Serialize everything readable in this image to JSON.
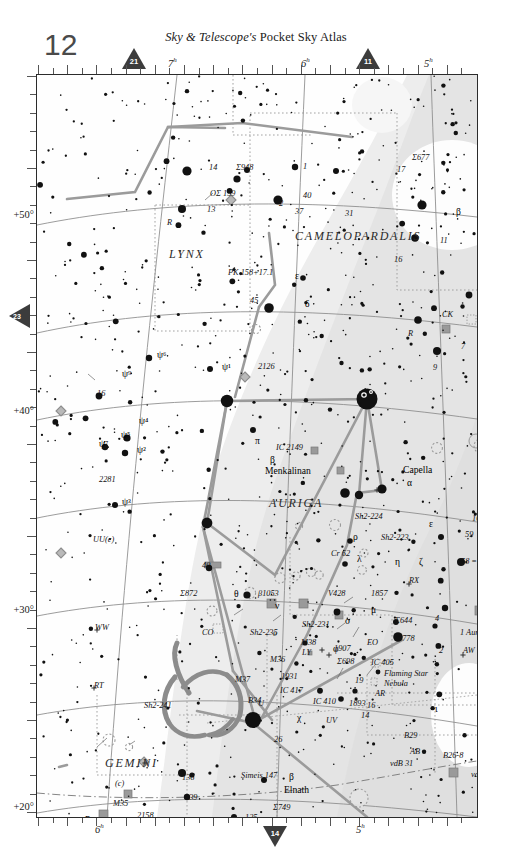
{
  "header": {
    "masthead_italic": "Sky & Telescope's",
    "masthead_rest": " Pocket Sky Atlas",
    "page_number": "12"
  },
  "page_links": {
    "top_left": "21",
    "top_right": "11",
    "bottom": "14",
    "left": "23"
  },
  "axes": {
    "ra_top": [
      "7",
      "6",
      "5"
    ],
    "ra_bottom": [
      "6",
      "5"
    ],
    "ra_unit": "h",
    "dec_labels": [
      "+50°",
      "+40°",
      "+30°",
      "+20°"
    ]
  },
  "constellations": [
    {
      "name": "LYNX",
      "x": 132,
      "y": 183
    },
    {
      "name": "CAMELOPARDALIS",
      "x": 258,
      "y": 165
    },
    {
      "name": "AURIGA",
      "x": 232,
      "y": 432
    },
    {
      "name": "GEMINI",
      "x": 68,
      "y": 692
    },
    {
      "name": "ORION",
      "x": 110,
      "y": 808
    },
    {
      "name": "TAURUS",
      "x": 290,
      "y": 775
    }
  ],
  "named_stars": [
    {
      "label": "Capella",
      "x": 366,
      "y": 398
    },
    {
      "label": "Menkalinan",
      "x": 228,
      "y": 399
    },
    {
      "label": "Elnath",
      "x": 247,
      "y": 718
    },
    {
      "label": "Propus",
      "x": 48,
      "y": 748
    }
  ],
  "greek_labels": [
    {
      "t": "α",
      "x": 370,
      "y": 411
    },
    {
      "t": "β",
      "x": 233,
      "y": 388
    },
    {
      "t": "π",
      "x": 218,
      "y": 369
    },
    {
      "t": "β",
      "x": 252,
      "y": 705
    },
    {
      "t": "ε",
      "x": 392,
      "y": 452
    },
    {
      "t": "ζ",
      "x": 382,
      "y": 490
    },
    {
      "t": "η",
      "x": 358,
      "y": 490
    },
    {
      "t": "θ",
      "x": 197,
      "y": 522
    },
    {
      "t": "ι",
      "x": 398,
      "y": 637
    },
    {
      "t": "λ",
      "x": 320,
      "y": 487
    },
    {
      "t": "μ",
      "x": 334,
      "y": 538
    },
    {
      "t": "ν",
      "x": 238,
      "y": 534
    },
    {
      "t": "ρ",
      "x": 316,
      "y": 465
    },
    {
      "t": "σ",
      "x": 308,
      "y": 549
    },
    {
      "t": "δ",
      "x": 268,
      "y": 232
    },
    {
      "t": "ε",
      "x": 258,
      "y": 204
    },
    {
      "t": "β",
      "x": 419,
      "y": 140
    },
    {
      "t": "η",
      "x": 57,
      "y": 764
    },
    {
      "t": "χ",
      "x": 260,
      "y": 646
    },
    {
      "t": "γ",
      "x": 63,
      "y": 791
    },
    {
      "t": "φ",
      "x": 296,
      "y": 577
    },
    {
      "t": "ψ¹",
      "x": 185,
      "y": 295
    },
    {
      "t": "ψ²",
      "x": 100,
      "y": 378
    },
    {
      "t": "ψ³",
      "x": 85,
      "y": 430
    },
    {
      "t": "ψ⁴",
      "x": 102,
      "y": 349
    },
    {
      "t": "ψ⁵",
      "x": 84,
      "y": 363
    },
    {
      "t": "ψ⁶",
      "x": 120,
      "y": 283
    },
    {
      "t": "ψ⁷",
      "x": 62,
      "y": 372
    },
    {
      "t": "ψ⁹",
      "x": 85,
      "y": 302
    }
  ],
  "deepsky_labels": [
    {
      "t": "Σ948",
      "x": 199,
      "y": 95
    },
    {
      "t": "ΟΣ 159",
      "x": 173,
      "y": 121
    },
    {
      "t": "Σ677",
      "x": 375,
      "y": 85
    },
    {
      "t": "PK 158+17.1",
      "x": 191,
      "y": 200
    },
    {
      "t": "RV",
      "x": 486,
      "y": 211
    },
    {
      "t": "CK",
      "x": 405,
      "y": 242
    },
    {
      "t": "B12",
      "x": 471,
      "y": 260
    },
    {
      "t": "1624",
      "x": 443,
      "y": 322
    },
    {
      "t": "2126",
      "x": 221,
      "y": 294
    },
    {
      "t": "IC 2149",
      "x": 239,
      "y": 375
    },
    {
      "t": "2281",
      "x": 62,
      "y": 407
    },
    {
      "t": "Sh2-224",
      "x": 318,
      "y": 444
    },
    {
      "t": "Sh2-223",
      "x": 344,
      "y": 465
    },
    {
      "t": "Cr 62",
      "x": 294,
      "y": 481
    },
    {
      "t": "1664",
      "x": 435,
      "y": 446
    },
    {
      "t": "1582",
      "x": 487,
      "y": 441
    },
    {
      "t": "59",
      "x": 428,
      "y": 462
    },
    {
      "t": "58 = e",
      "x": 424,
      "y": 489
    },
    {
      "t": "RX",
      "x": 372,
      "y": 508
    },
    {
      "t": "1857",
      "x": 334,
      "y": 521
    },
    {
      "t": "V428",
      "x": 291,
      "y": 521
    },
    {
      "t": "Σ872",
      "x": 143,
      "y": 521
    },
    {
      "t": "β1053",
      "x": 221,
      "y": 521
    },
    {
      "t": "Σ644",
      "x": 358,
      "y": 548
    },
    {
      "t": "1778",
      "x": 361,
      "y": 566
    },
    {
      "t": "1 Aur",
      "x": 423,
      "y": 560
    },
    {
      "t": "AW",
      "x": 426,
      "y": 578
    },
    {
      "t": "Sh2-231",
      "x": 265,
      "y": 552
    },
    {
      "t": "Sh2-235",
      "x": 213,
      "y": 560
    },
    {
      "t": "M38",
      "x": 264,
      "y": 570
    },
    {
      "t": "1907",
      "x": 297,
      "y": 576
    },
    {
      "t": "LY",
      "x": 265,
      "y": 580
    },
    {
      "t": "M36",
      "x": 233,
      "y": 587
    },
    {
      "t": "Σ698",
      "x": 300,
      "y": 589
    },
    {
      "t": "1931",
      "x": 244,
      "y": 604
    },
    {
      "t": "IC 417",
      "x": 243,
      "y": 618
    },
    {
      "t": "M37",
      "x": 198,
      "y": 607
    },
    {
      "t": "B34",
      "x": 211,
      "y": 628
    },
    {
      "t": "IC 410",
      "x": 276,
      "y": 629
    },
    {
      "t": "1893",
      "x": 312,
      "y": 631
    },
    {
      "t": "IC 405",
      "x": 334,
      "y": 590
    },
    {
      "t": "Flaming Star",
      "x": 347,
      "y": 601
    },
    {
      "t": "Nebula",
      "x": 347,
      "y": 611
    },
    {
      "t": "AR",
      "x": 338,
      "y": 621
    },
    {
      "t": "19",
      "x": 318,
      "y": 608
    },
    {
      "t": "16",
      "x": 330,
      "y": 633
    },
    {
      "t": "14",
      "x": 324,
      "y": 643
    },
    {
      "t": "UV",
      "x": 289,
      "y": 648
    },
    {
      "t": "EO",
      "x": 330,
      "y": 570
    },
    {
      "t": "CO",
      "x": 165,
      "y": 560
    },
    {
      "t": "WW",
      "x": 58,
      "y": 555
    },
    {
      "t": "UU(c)",
      "x": 56,
      "y": 467
    },
    {
      "t": "RT",
      "x": 57,
      "y": 613
    },
    {
      "t": "Sh2-241",
      "x": 107,
      "y": 633
    },
    {
      "t": "1579",
      "x": 481,
      "y": 599
    },
    {
      "t": "26",
      "x": 237,
      "y": 667
    },
    {
      "t": "B29",
      "x": 367,
      "y": 663
    },
    {
      "t": "AB",
      "x": 373,
      "y": 679
    },
    {
      "t": "vdB 31",
      "x": 353,
      "y": 691
    },
    {
      "t": "B26-8",
      "x": 406,
      "y": 683
    },
    {
      "t": "vdB 29",
      "x": 434,
      "y": 702
    },
    {
      "t": "Simeis 147",
      "x": 204,
      "y": 703
    },
    {
      "t": "Σ749",
      "x": 236,
      "y": 735
    },
    {
      "t": "136",
      "x": 145,
      "y": 705
    },
    {
      "t": "139",
      "x": 148,
      "y": 725
    },
    {
      "t": "132",
      "x": 155,
      "y": 749
    },
    {
      "t": "125",
      "x": 208,
      "y": 745
    },
    {
      "t": "TU",
      "x": 196,
      "y": 757
    },
    {
      "t": "118",
      "x": 260,
      "y": 763
    },
    {
      "t": "121",
      "x": 230,
      "y": 781
    },
    {
      "t": "103",
      "x": 319,
      "y": 789
    },
    {
      "t": "1746",
      "x": 360,
      "y": 795
    },
    {
      "t": "IC 2087",
      "x": 430,
      "y": 772
    },
    {
      "t": "Ced 33",
      "x": 479,
      "y": 760
    },
    {
      "t": "M35",
      "x": 76,
      "y": 731
    },
    {
      "t": "2158",
      "x": 100,
      "y": 743
    },
    {
      "t": "BU",
      "x": 57,
      "y": 763
    },
    {
      "t": "1",
      "x": 76,
      "y": 760
    },
    {
      "t": "2129",
      "x": 78,
      "y": 771
    },
    {
      "t": "90°",
      "x": 101,
      "y": 760
    },
    {
      "t": "BQ",
      "x": 105,
      "y": 778
    },
    {
      "t": "TV",
      "x": 40,
      "y": 785
    },
    {
      "t": "Sh2-247",
      "x": 85,
      "y": 787
    },
    {
      "t": "2174-5",
      "x": 62,
      "y": 806
    },
    {
      "t": "ECLIPTIC",
      "x": 248,
      "y": 793
    },
    {
      "t": "80°",
      "x": 296,
      "y": 799
    },
    {
      "t": "14",
      "x": 172,
      "y": 95
    },
    {
      "t": "13",
      "x": 170,
      "y": 137
    },
    {
      "t": "45",
      "x": 213,
      "y": 228
    },
    {
      "t": "1",
      "x": 266,
      "y": 94
    },
    {
      "t": "40",
      "x": 266,
      "y": 123
    },
    {
      "t": "2",
      "x": 242,
      "y": 131
    },
    {
      "t": "37",
      "x": 258,
      "y": 139
    },
    {
      "t": "31",
      "x": 308,
      "y": 141
    },
    {
      "t": "17",
      "x": 360,
      "y": 97
    },
    {
      "t": "11",
      "x": 403,
      "y": 168
    },
    {
      "t": "16",
      "x": 357,
      "y": 187
    },
    {
      "t": "4",
      "x": 451,
      "y": 220
    },
    {
      "t": "7",
      "x": 424,
      "y": 274
    },
    {
      "t": "2",
      "x": 459,
      "y": 278
    },
    {
      "t": "3",
      "x": 457,
      "y": 287
    },
    {
      "t": "9",
      "x": 396,
      "y": 295
    },
    {
      "t": "R",
      "x": 130,
      "y": 150
    },
    {
      "t": "R",
      "x": 371,
      "y": 261
    },
    {
      "t": "16",
      "x": 60,
      "y": 321
    },
    {
      "t": "40",
      "x": 165,
      "y": 493
    },
    {
      "t": "(c)",
      "x": 78,
      "y": 711
    },
    {
      "t": "υ",
      "x": 236,
      "y": 561
    },
    {
      "t": "U",
      "x": 221,
      "y": 631
    },
    {
      "t": "9",
      "x": 440,
      "y": 253
    },
    {
      "t": "4",
      "x": 398,
      "y": 546
    },
    {
      "t": "2",
      "x": 402,
      "y": 578
    }
  ]
}
